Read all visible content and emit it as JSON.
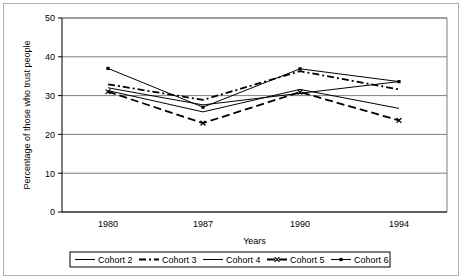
{
  "chart_data": {
    "type": "line",
    "title": "",
    "xlabel": "Years",
    "ylabel": "Percentage of those who trust people",
    "categories": [
      "1980",
      "1987",
      "1990",
      "1994"
    ],
    "ylim": [
      0,
      50
    ],
    "yticks": [
      0,
      10,
      20,
      30,
      40,
      50
    ],
    "grid": true,
    "legend_position": "bottom",
    "series": [
      {
        "name": "Cohort 2",
        "style": "solid",
        "marker": "none",
        "width": 1,
        "values": [
          31.3,
          25.8,
          31.6,
          26.7
        ]
      },
      {
        "name": "Cohort 3",
        "style": "dash-dot",
        "marker": "none",
        "width": 1.8,
        "values": [
          32.9,
          28.9,
          36.3,
          31.6
        ]
      },
      {
        "name": "Cohort 4",
        "style": "solid",
        "marker": "none",
        "width": 1,
        "values": [
          32.0,
          27.6,
          30.6,
          33.6
        ]
      },
      {
        "name": "Cohort 5",
        "style": "dashed",
        "marker": "x",
        "width": 1.8,
        "values": [
          31.0,
          22.9,
          30.9,
          23.6
        ]
      },
      {
        "name": "Cohort 6",
        "style": "solid",
        "marker": "dot",
        "width": 1,
        "values": [
          37.0,
          27.0,
          36.9,
          33.6
        ]
      }
    ]
  },
  "axis": {
    "y_tick_labels": [
      "0",
      "10",
      "20",
      "30",
      "40",
      "50"
    ],
    "x_tick_labels": [
      "1980",
      "1987",
      "1990",
      "1994"
    ],
    "x_title": "Years",
    "y_title": "Percentage of those who trust people"
  },
  "legend": {
    "items": [
      {
        "label": "Cohort 2"
      },
      {
        "label": "Cohort 3"
      },
      {
        "label": "Cohort 4"
      },
      {
        "label": "Cohort 5"
      },
      {
        "label": "Cohort 6"
      }
    ]
  },
  "colors": {
    "line": "#000000",
    "grid": "#7f7f7f",
    "axis": "#000000",
    "background": "#ffffff",
    "frame": "#b0b0b0"
  }
}
